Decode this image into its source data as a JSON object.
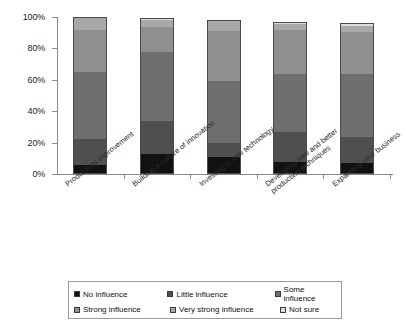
{
  "chart_data": {
    "type": "bar",
    "subtype": "stacked-percentage-column",
    "title": "",
    "xlabel": "",
    "ylabel": "",
    "ylim": [
      0,
      100
    ],
    "ytick_labels": [
      "0%",
      "20%",
      "40%",
      "60%",
      "80%",
      "100%"
    ],
    "ytick_values": [
      0,
      20,
      40,
      60,
      80,
      100
    ],
    "grid": false,
    "legend_position": "bottom",
    "categories": [
      "Productivity improvement",
      "Building a culture of innovation",
      "Investing in new technology",
      "Developing new and better\nproduction techniques",
      "Expanding your business"
    ],
    "series": [
      {
        "name": "No influence",
        "color": "#111111",
        "values": [
          5.5,
          12.5,
          11.0,
          7.5,
          7.0
        ]
      },
      {
        "name": "Little influence",
        "color": "#4f4f4f",
        "values": [
          17.0,
          21.0,
          9.0,
          19.0,
          16.5
        ]
      },
      {
        "name": "Some influence",
        "color": "#6e6e6e",
        "values": [
          42.5,
          44.0,
          39.5,
          37.5,
          40.5
        ]
      },
      {
        "name": "Strong influence",
        "color": "#8f8f8f",
        "values": [
          26.5,
          16.0,
          31.5,
          27.5,
          26.5
        ]
      },
      {
        "name": "Very strong influence",
        "color": "#a8a8a8",
        "values": [
          8.5,
          4.5,
          6.5,
          4.0,
          4.0
        ]
      },
      {
        "name": "Not sure",
        "color": "#dcdcdc",
        "values": [
          0.0,
          1.5,
          0.5,
          1.5,
          1.5
        ]
      }
    ]
  },
  "legend": {
    "items": [
      {
        "label": "No influence"
      },
      {
        "label": "Little influence"
      },
      {
        "label": "Some influence"
      },
      {
        "label": "Strong influence"
      },
      {
        "label": "Very strong influence"
      },
      {
        "label": "Not sure"
      }
    ]
  }
}
